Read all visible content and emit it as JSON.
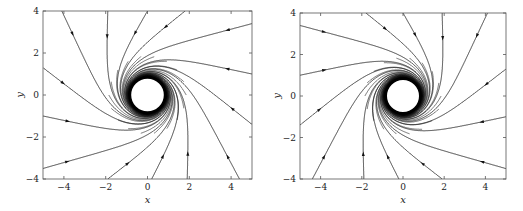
{
  "chart_data": [
    {
      "type": "line",
      "subtype": "streamplot",
      "title": "",
      "xlabel": "x",
      "ylabel": "y",
      "xlim": [
        -5,
        5
      ],
      "ylim": [
        -4,
        4
      ],
      "xticks": [
        -4,
        -2,
        0,
        2,
        4
      ],
      "xtick_labels": [
        "−4",
        "−2",
        "0",
        "2",
        "4"
      ],
      "yticks": [
        -4,
        -2,
        0,
        2,
        4
      ],
      "ytick_labels": [
        "−4",
        "−2",
        "0",
        "2",
        "4"
      ],
      "grid": false,
      "rotation": "counterclockwise",
      "limit_cycle_radius": 0.85,
      "dense_annulus_outer_radius": 1.8,
      "frame_px": {
        "left": 43,
        "right": 252,
        "top": 11,
        "bottom": 179
      },
      "seeds": [
        [
          -4.1,
          4
        ],
        [
          -1.9,
          4
        ],
        [
          0.0,
          4
        ],
        [
          1.8,
          4
        ],
        [
          5,
          3.4
        ],
        [
          5,
          1.0
        ],
        [
          5,
          -1.4
        ],
        [
          4.4,
          -4
        ],
        [
          1.9,
          -4
        ],
        [
          0.2,
          -4
        ],
        [
          -1.9,
          -4
        ],
        [
          -5,
          -3.5
        ],
        [
          -5,
          -1.0
        ],
        [
          -5,
          1.3
        ]
      ]
    },
    {
      "type": "line",
      "subtype": "streamplot",
      "title": "",
      "xlabel": "x",
      "ylabel": "y",
      "xlim": [
        -5,
        5
      ],
      "ylim": [
        -4,
        4
      ],
      "xticks": [
        -4,
        -2,
        0,
        2,
        4
      ],
      "xtick_labels": [
        "−4",
        "−2",
        "0",
        "2",
        "4"
      ],
      "yticks": [
        -4,
        -2,
        0,
        2,
        4
      ],
      "ytick_labels": [
        "−4",
        "−2",
        "0",
        "2",
        "4"
      ],
      "grid": false,
      "rotation": "clockwise",
      "limit_cycle_radius": 0.85,
      "dense_annulus_outer_radius": 1.8,
      "frame_px": {
        "left": 300,
        "right": 506,
        "top": 13,
        "bottom": 179
      },
      "seeds": [
        [
          4.1,
          4
        ],
        [
          1.9,
          4
        ],
        [
          0.0,
          4
        ],
        [
          -1.8,
          4
        ],
        [
          -5,
          3.4
        ],
        [
          -5,
          1.0
        ],
        [
          -5,
          -1.4
        ],
        [
          -4.4,
          -4
        ],
        [
          -1.9,
          -4
        ],
        [
          -0.2,
          -4
        ],
        [
          1.9,
          -4
        ],
        [
          5,
          -3.5
        ],
        [
          5,
          -1.0
        ],
        [
          5,
          1.3
        ]
      ]
    }
  ],
  "panels": [
    {
      "xlabel": "x",
      "ylabel": "y"
    },
    {
      "xlabel": "x",
      "ylabel": "y"
    }
  ]
}
